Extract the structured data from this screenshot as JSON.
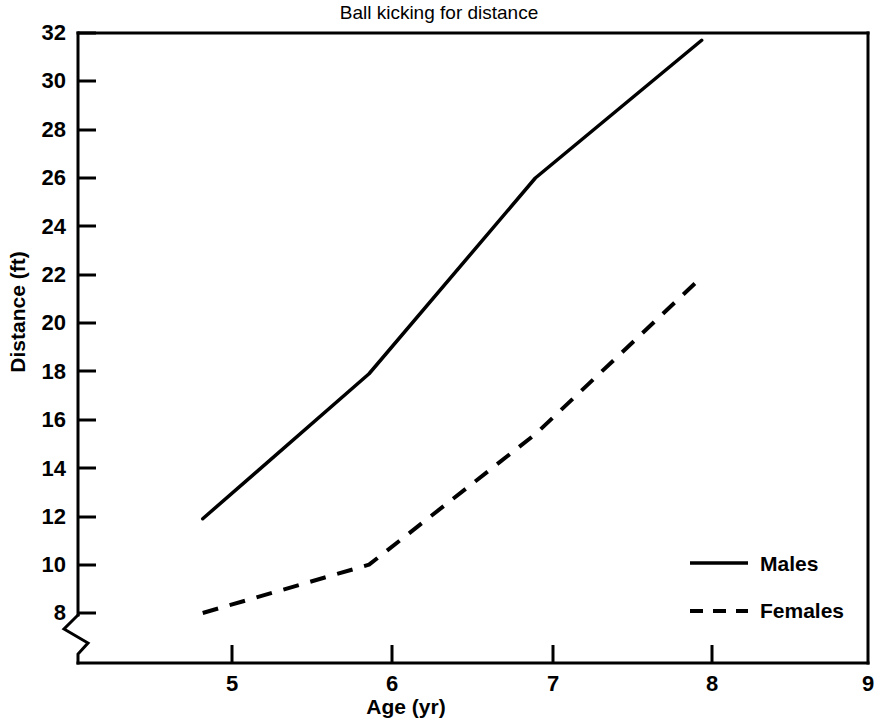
{
  "chart_data": {
    "type": "line",
    "title": "Ball kicking for distance",
    "xlabel": "Age (yr)",
    "ylabel": "Distance (ft)",
    "x": [
      5,
      6,
      7,
      8
    ],
    "xlim": [
      4.25,
      9.0
    ],
    "ylim": [
      7.2,
      32.0
    ],
    "xticks": [
      5,
      6,
      7,
      8,
      9
    ],
    "xtick_labels": [
      "5",
      "6",
      "7",
      "8",
      "9"
    ],
    "yticks": [
      8,
      10,
      12,
      14,
      16,
      18,
      20,
      22,
      24,
      26,
      28,
      30,
      32
    ],
    "ytick_labels": [
      "8",
      "10",
      "12",
      "14",
      "16",
      "18",
      "20",
      "22",
      "24",
      "26",
      "28",
      "30",
      "32"
    ],
    "y_axis_break": true,
    "grid": false,
    "legend_position": "lower right",
    "series": [
      {
        "name": "Males",
        "linestyle": "solid",
        "color": "#000000",
        "values": [
          11.9,
          17.9,
          26.0,
          31.7
        ]
      },
      {
        "name": "Females",
        "linestyle": "dashed",
        "color": "#000000",
        "values": [
          8.0,
          10.0,
          15.4,
          21.9
        ]
      }
    ]
  },
  "legend": {
    "items": [
      {
        "label": "Males",
        "linestyle": "solid"
      },
      {
        "label": "Females",
        "linestyle": "dashed"
      }
    ]
  },
  "axis_break_symbol": "y-axis-break-zigzag",
  "colors": {
    "background": "#ffffff",
    "foreground": "#000000"
  }
}
